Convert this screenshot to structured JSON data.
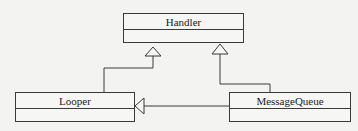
{
  "diagram": {
    "type": "uml-class-diagram",
    "classes": [
      {
        "id": "handler",
        "name": "Handler"
      },
      {
        "id": "looper",
        "name": "Looper"
      },
      {
        "id": "message_queue",
        "name": "MessageQueue"
      }
    ],
    "relationships": [
      {
        "from": "Looper",
        "to": "Handler",
        "kind": "generalization"
      },
      {
        "from": "MessageQueue",
        "to": "Handler",
        "kind": "generalization"
      },
      {
        "from": "MessageQueue",
        "to": "Looper",
        "kind": "generalization"
      }
    ],
    "colors": {
      "line": "#3a3a3a",
      "background": "#f3f3f1"
    }
  }
}
